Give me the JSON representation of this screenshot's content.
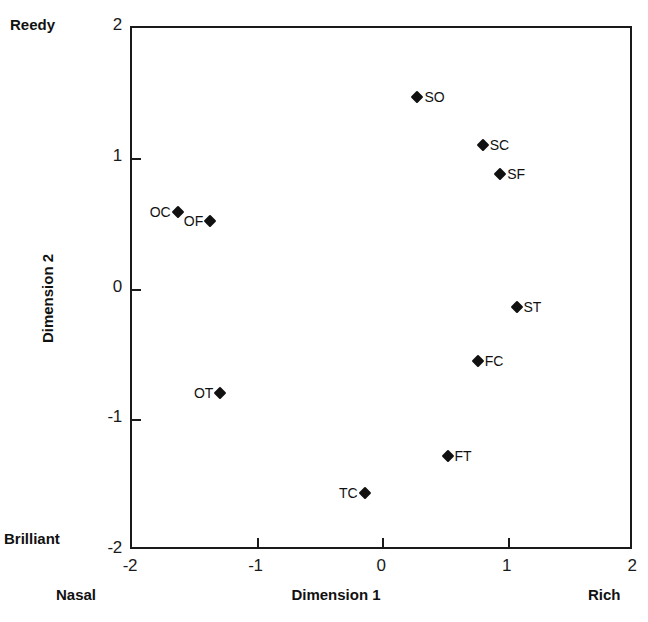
{
  "chart_data": {
    "type": "scatter",
    "title": "",
    "xlabel": "Dimension 1",
    "ylabel": "Dimension 2",
    "xlim": [
      -2,
      2
    ],
    "ylim": [
      -2,
      2
    ],
    "grid": false,
    "legend": "none",
    "xticks": [
      "-2",
      "-1",
      "0",
      "1",
      "2"
    ],
    "xtick_values": [
      -2,
      -1,
      0,
      1,
      2
    ],
    "yticks": [
      "2",
      "1",
      "0",
      "-1",
      "-2"
    ],
    "ytick_values": [
      2,
      1,
      0,
      -1,
      -2
    ],
    "axis_pole_labels": {
      "y_top": "Reedy",
      "y_bottom": "Brilliant",
      "x_left": "Nasal",
      "x_right": "Rich"
    },
    "marker_shape": "diamond",
    "marker_color": "#111111",
    "points": [
      {
        "label": "SO",
        "x": 0.29,
        "y": 1.46,
        "label_side": "right"
      },
      {
        "label": "SC",
        "x": 0.81,
        "y": 1.09,
        "label_side": "right"
      },
      {
        "label": "SF",
        "x": 0.95,
        "y": 0.87,
        "label_side": "right"
      },
      {
        "label": "OC",
        "x": -1.62,
        "y": 0.58,
        "label_side": "left"
      },
      {
        "label": "OF",
        "x": -1.36,
        "y": 0.51,
        "label_side": "left"
      },
      {
        "label": "ST",
        "x": 1.08,
        "y": -0.15,
        "label_side": "right"
      },
      {
        "label": "FC",
        "x": 0.77,
        "y": -0.56,
        "label_side": "right"
      },
      {
        "label": "OT",
        "x": -1.28,
        "y": -0.81,
        "label_side": "left"
      },
      {
        "label": "FT",
        "x": 0.53,
        "y": -1.29,
        "label_side": "right"
      },
      {
        "label": "TC",
        "x": -0.13,
        "y": -1.57,
        "label_side": "left"
      }
    ]
  }
}
